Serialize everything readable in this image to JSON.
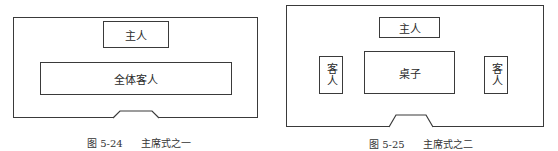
{
  "figures": [
    {
      "id": "fig-5-24",
      "caption": {
        "number": "图 5-24",
        "title": "主席式之一"
      },
      "host_label": "主人",
      "guests_label": "全体客人",
      "door": "door"
    },
    {
      "id": "fig-5-25",
      "caption": {
        "number": "图 5-25",
        "title": "主席式之二"
      },
      "host_label": "主人",
      "table_label": "桌子",
      "left_guest_label": "客人",
      "right_guest_label": "客人",
      "door": "door"
    }
  ],
  "colors": {
    "line": "#3a3a3a",
    "background": "#ffffff",
    "text": "#2a2a2a"
  }
}
